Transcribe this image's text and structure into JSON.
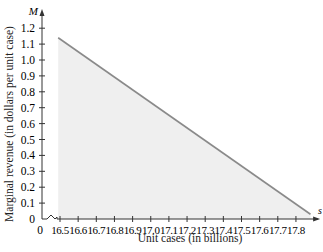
{
  "chart_data": {
    "type": "area",
    "title": "",
    "xlabel": "Unit cases (in billions)",
    "ylabel": "Marginal revenue (in dollars per unit case)",
    "x_axis_var": "s",
    "y_axis_var": "M",
    "x_ticks": [
      "0",
      "16.5",
      "16.6",
      "16.7",
      "16.8",
      "16.9",
      "17.0",
      "17.1",
      "17.2",
      "17.3",
      "17.4",
      "17.5",
      "17.6",
      "17.7",
      "17.8"
    ],
    "y_ticks": [
      "0",
      "0.1",
      "0.2",
      "0.3",
      "0.4",
      "0.5",
      "0.6",
      "0.7",
      "0.8",
      "0.9",
      "1.0",
      "1.1",
      "1.2"
    ],
    "xlim": [
      16.45,
      17.9
    ],
    "ylim": [
      0,
      1.2
    ],
    "axis_break_x": true,
    "grid": false,
    "series": [
      {
        "name": "Marginal revenue",
        "x": [
          16.49,
          17.88
        ],
        "y": [
          1.14,
          0.03
        ],
        "line_color": "#8a8a8a",
        "fill_color": "#efefef",
        "shaded_area": true
      }
    ]
  },
  "labels": {
    "xlabel": "Unit cases (in billions)",
    "ylabel": "Marginal revenue (in dollars per unit case)",
    "x_var": "s",
    "y_var": "M"
  }
}
